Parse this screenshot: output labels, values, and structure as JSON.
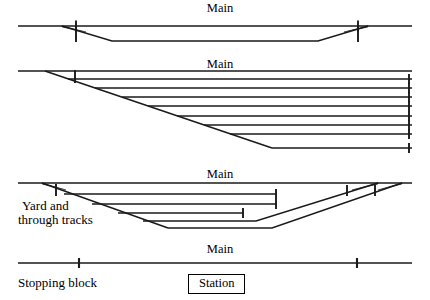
{
  "figure": {
    "title_labels": {
      "main": "Main"
    },
    "panels": [
      {
        "id": "panel-1-crossover",
        "main_label": "Main",
        "main_label_x": 220,
        "main_label_y": 2,
        "description": "Main line with a single passing siding formed by two crossovers"
      },
      {
        "id": "panel-2-yard-ladder",
        "main_label": "Main",
        "main_label_x": 220,
        "main_label_y": 58,
        "description": "Main line with an eight track stub ended yard served by a single ladder"
      },
      {
        "id": "panel-3-yard-through",
        "main_label": "Main",
        "main_label_x": 220,
        "main_label_y": 168,
        "description": "Main line with yard and through tracks, three stub tracks and two through tracks"
      },
      {
        "id": "panel-4-station",
        "main_label": "Main",
        "main_label_x": 220,
        "main_label_y": 243,
        "description": "Plain main line through the station"
      }
    ],
    "annotations": [
      {
        "id": "yard-and-through-tracks",
        "text_line_1": "Yard and",
        "text_line_2": "through tracks",
        "x": 18,
        "y": 200
      },
      {
        "id": "stopping-block-legend",
        "text": "Stopping block",
        "x": 18,
        "y": 277
      },
      {
        "id": "station-legend",
        "text": "Station",
        "x": 190,
        "y": 275
      }
    ],
    "colors": {
      "ink": "#1a1a1a",
      "paper": "#ffffff"
    },
    "line_weights": {
      "track": 1.35,
      "stopping_block": 1.9
    },
    "geometry": {
      "panel1": {
        "main_line": {
          "x1": 18,
          "y1": 26,
          "x2": 412,
          "y2": 26
        },
        "siding": [
          {
            "x1": 62,
            "y1": 26,
            "x2": 112,
            "y2": 41
          },
          {
            "x1": 112,
            "y1": 41,
            "x2": 318,
            "y2": 41
          },
          {
            "x1": 318,
            "y1": 41,
            "x2": 368,
            "y2": 26
          }
        ],
        "stopping_blocks": [
          {
            "x": 76,
            "y": 26
          },
          {
            "x": 76,
            "y": 38
          },
          {
            "x": 358,
            "y": 26
          },
          {
            "x": 358,
            "y": 38
          }
        ]
      },
      "panel2": {
        "main_line": {
          "x1": 18,
          "y1": 71,
          "x2": 412,
          "y2": 71
        },
        "ladder": {
          "x1": 45,
          "y1": 71,
          "x2": 272,
          "y2": 148
        },
        "yard_track_count": 8,
        "yard_track_right_x": 412,
        "yard_track_ys": [
          79,
          88,
          97,
          106,
          116,
          125,
          134,
          145
        ],
        "stopping_blocks": [
          {
            "x": 75,
            "y": 76
          }
        ]
      },
      "panel3": {
        "main_line": {
          "x1": 18,
          "y1": 183,
          "x2": 412,
          "y2": 183
        },
        "ladder": {
          "x1": 42,
          "y1": 183,
          "x2": 168,
          "y2": 228
        },
        "stub_tracks": [
          {
            "y": 194,
            "x_end": 277
          },
          {
            "y": 204,
            "x_end": 277
          },
          {
            "y": 213,
            "x_end": 243
          }
        ],
        "through_tracks": 2,
        "stopping_blocks": [
          {
            "x": 56,
            "y": 189
          },
          {
            "x": 347,
            "y": 189
          },
          {
            "x": 375,
            "y": 189
          }
        ]
      },
      "panel4": {
        "main_line": {
          "x1": 18,
          "y1": 263,
          "x2": 412,
          "y2": 263
        },
        "stopping_blocks": [
          {
            "x": 79,
            "y": 263
          },
          {
            "x": 357,
            "y": 263
          }
        ]
      }
    }
  }
}
